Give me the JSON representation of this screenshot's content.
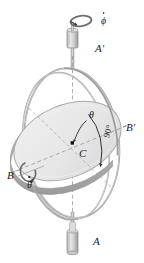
{
  "figure": {
    "background_color": "#ffffff",
    "width": 144,
    "height": 263,
    "labels": {
      "bearing_bottom": "A",
      "bearing_top": "A'",
      "axis_left": "B",
      "axis_right": "B'",
      "center": "C",
      "angle_theta": "θ",
      "angle_right": "90°",
      "rate_phi_dot": "ϕ",
      "rate_theta_dot": "θ"
    },
    "colors": {
      "ink": "#1a1a1a",
      "ring_stroke": "#8a8a8a",
      "ring_light": "#d6d6d6",
      "disk_fill": "#e9e9e9",
      "disk_edge": "#b4b4b4",
      "disk_rim": "#a8a8a8",
      "bearing_fill": "#d2d2d2",
      "bearing_stroke": "#909090",
      "shaft": "#9a9a9a",
      "dash_axis": "#8d8d8d",
      "arrow": "#2b2b2b"
    },
    "elements": {
      "outer_gimbal_ring": "vertical circular ring",
      "inner_ring": "second circular ring offset",
      "rotor_disk": "tilted flat disk with thickness",
      "spin_axis": "vertical dashed axis A to A'",
      "transverse_axis": "dashed axis B to B'",
      "precession_arrow": "curved circular arrow about vertical axis",
      "spin_arrow": "curved circular arrow about B-B' axis",
      "theta_arc_arrow": "arc from vertical axis sweeping to disk normal",
      "right_angle_arc": "arc labelled 90 degrees"
    }
  }
}
